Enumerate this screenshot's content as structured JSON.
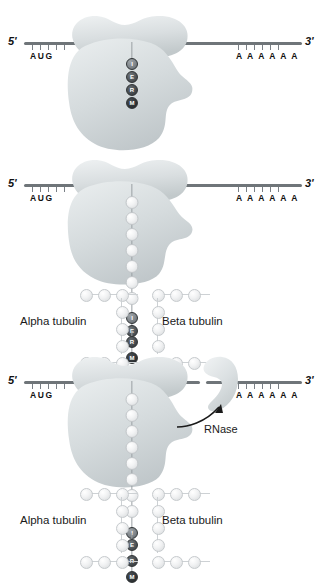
{
  "figure": {
    "panel_count": 3
  },
  "palette": {
    "mrna_strand": "#6f7579",
    "ribosome_light": "#e2e6e7",
    "ribosome_mid": "#cdd3d5",
    "ribosome_dark": "#b9c0c2",
    "bead_light": "#f1f2f3",
    "bead_dark": "#3a3e41",
    "text": "#1a1a1a",
    "background": "#ffffff"
  },
  "mrna": {
    "five_prime_label": "5'",
    "three_prime_label": "3'",
    "start_codon": "AUG",
    "poly_a_tail": "A A A A A A",
    "poly_a_count": 6,
    "start_tick_count": 5,
    "tail_tick_count": 6
  },
  "nascent_peptide": {
    "motif_letters": [
      "I",
      "E",
      "R",
      "M"
    ],
    "motif_name": "MREI",
    "description": "N-terminal tubulin autoregulatory motif, read N-to-C from bottom"
  },
  "panels": [
    {
      "id": "panel-1",
      "index": 1,
      "caption": "Ribosome translating tubulin mRNA; nascent MREI motif emerging",
      "has_ribosome": true,
      "has_lattice": false,
      "has_rnase": false,
      "nascent_light_beads": 0,
      "motif_exposed": true
    },
    {
      "id": "panel-2",
      "index": 2,
      "caption": "Tubulin heterodimer binds the exposed nascent MREI motif",
      "has_ribosome": true,
      "has_lattice": true,
      "has_rnase": false,
      "nascent_light_beads": 7,
      "motif_exposed": true
    },
    {
      "id": "panel-3",
      "index": 3,
      "caption": "RNase is recruited and cleaves the tubulin mRNA",
      "has_ribosome": true,
      "has_lattice": true,
      "has_rnase": true,
      "nascent_light_beads": 8,
      "motif_exposed": true,
      "mrna_cleaved": true
    }
  ],
  "tubulin": {
    "alpha_label": "Alpha tubulin",
    "beta_label": "Beta tubulin"
  },
  "rnase": {
    "label": "RNase",
    "shape": "crescent",
    "arrow": "curved-arrow-pointing-up-right"
  }
}
